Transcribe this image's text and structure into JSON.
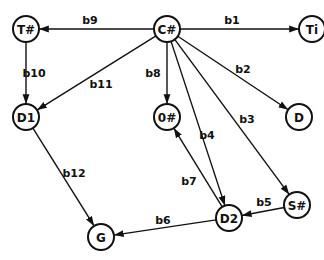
{
  "nodes": [
    {
      "id": "T#",
      "label": "T#",
      "x": 26,
      "y": 29
    },
    {
      "id": "C#",
      "label": "C#",
      "x": 167,
      "y": 29
    },
    {
      "id": "Ti",
      "label": "Ti",
      "x": 312,
      "y": 29
    },
    {
      "id": "D1",
      "label": "D1",
      "x": 26,
      "y": 117
    },
    {
      "id": "O#",
      "label": "0#",
      "x": 167,
      "y": 117
    },
    {
      "id": "D",
      "label": "D",
      "x": 299,
      "y": 117
    },
    {
      "id": "G",
      "label": "G",
      "x": 101,
      "y": 237
    },
    {
      "id": "D2",
      "label": "D2",
      "x": 229,
      "y": 218
    },
    {
      "id": "S#",
      "label": "S#",
      "x": 297,
      "y": 205
    }
  ],
  "edges": [
    {
      "label": "b1",
      "from": "C#",
      "to": "Ti",
      "lx": 232,
      "ly": 20
    },
    {
      "label": "b2",
      "from": "C#",
      "to": "D",
      "lx": 243,
      "ly": 69
    },
    {
      "label": "b3",
      "from": "C#",
      "to": "S#",
      "lx": 247,
      "ly": 119
    },
    {
      "label": "b4",
      "from": "C#",
      "to": "D2",
      "lx": 207,
      "ly": 135
    },
    {
      "label": "b5",
      "from": "S#",
      "to": "D2",
      "lx": 264,
      "ly": 202
    },
    {
      "label": "b6",
      "from": "D2",
      "to": "G",
      "lx": 163,
      "ly": 220
    },
    {
      "label": "b7",
      "from": "D2",
      "to": "O#",
      "lx": 189,
      "ly": 181
    },
    {
      "label": "b8",
      "from": "C#",
      "to": "O#",
      "lx": 153,
      "ly": 73
    },
    {
      "label": "b9",
      "from": "C#",
      "to": "T#",
      "lx": 90,
      "ly": 20
    },
    {
      "label": "b10",
      "from": "T#",
      "to": "D1",
      "lx": 34,
      "ly": 73
    },
    {
      "label": "b11",
      "from": "C#",
      "to": "D1",
      "lx": 101,
      "ly": 84
    },
    {
      "label": "b12",
      "from": "D1",
      "to": "G",
      "lx": 74,
      "ly": 173
    }
  ]
}
